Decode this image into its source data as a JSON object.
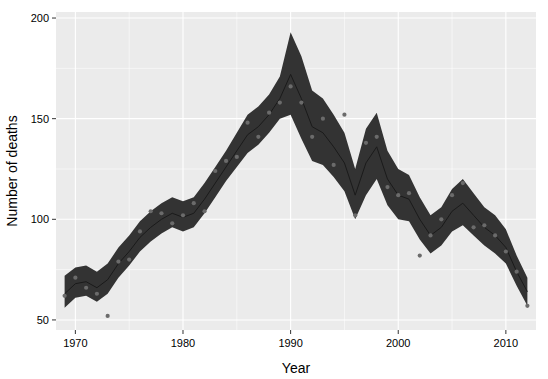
{
  "chart_data": {
    "type": "line",
    "title": "",
    "subtitle": "",
    "xlabel": "Year",
    "ylabel": "Number of deaths",
    "xlim": [
      1968.2,
      1912.0
    ],
    "x_range": [
      1968.2,
      2012.8
    ],
    "ylim": [
      45,
      203
    ],
    "y_ticks": [
      50,
      100,
      150,
      200
    ],
    "y_tick_labels": [
      "50",
      "100",
      "150",
      "200"
    ],
    "x_ticks": [
      1970,
      1980,
      1990,
      2000,
      2010
    ],
    "x_tick_labels": [
      "1970",
      "1980",
      "1990",
      "2000",
      "2010"
    ],
    "x_minor_ticks": [
      1975,
      1985,
      1995,
      2005
    ],
    "y_minor_ticks": [
      75,
      125,
      175
    ],
    "grid": true,
    "legend": "none",
    "panel_background": "#ebebeb",
    "grid_color": "#ffffff",
    "ribbon_color": "#333333",
    "line_color": "#1a1a1a",
    "point_color": "#6b6b6b",
    "series": [
      {
        "name": "Fitted number of deaths",
        "x": [
          1969,
          1970,
          1971,
          1972,
          1973,
          1974,
          1975,
          1976,
          1977,
          1978,
          1979,
          1980,
          1981,
          1982,
          1983,
          1984,
          1985,
          1986,
          1987,
          1988,
          1989,
          1990,
          1991,
          1992,
          1993,
          1994,
          1995,
          1996,
          1997,
          1998,
          1999,
          2000,
          2001,
          2002,
          2003,
          2004,
          2005,
          2006,
          2007,
          2008,
          2009,
          2010,
          2011,
          2012
        ],
        "fit": [
          63,
          68,
          69,
          66,
          70,
          78,
          84,
          91,
          96,
          100,
          103,
          101,
          103,
          110,
          118,
          126,
          134,
          142,
          146,
          152,
          160,
          172,
          160,
          146,
          143,
          136,
          128,
          112,
          128,
          136,
          120,
          112,
          110,
          100,
          92,
          96,
          104,
          108,
          102,
          96,
          92,
          86,
          74,
          64
        ],
        "lower": [
          56,
          61,
          62,
          59,
          63,
          71,
          77,
          84,
          89,
          93,
          96,
          94,
          96,
          103,
          111,
          119,
          126,
          133,
          137,
          143,
          150,
          152,
          140,
          129,
          127,
          121,
          114,
          100,
          112,
          120,
          107,
          100,
          99,
          90,
          83,
          87,
          94,
          97,
          92,
          87,
          83,
          78,
          67,
          57
        ],
        "upper": [
          72,
          76,
          77,
          74,
          78,
          86,
          92,
          99,
          104,
          108,
          111,
          109,
          111,
          118,
          126,
          134,
          143,
          152,
          156,
          162,
          171,
          193,
          181,
          164,
          160,
          152,
          143,
          125,
          145,
          153,
          134,
          125,
          122,
          111,
          102,
          106,
          115,
          120,
          113,
          106,
          102,
          95,
          82,
          71
        ]
      }
    ],
    "observed_points": {
      "name": "Observed deaths",
      "x": [
        1969,
        1970,
        1971,
        1972,
        1973,
        1974,
        1975,
        1976,
        1977,
        1978,
        1979,
        1980,
        1981,
        1982,
        1983,
        1984,
        1985,
        1986,
        1987,
        1988,
        1989,
        1990,
        1991,
        1992,
        1993,
        1994,
        1995,
        1996,
        1997,
        1998,
        1999,
        2000,
        2001,
        2002,
        2003,
        2004,
        2005,
        2006,
        2007,
        2008,
        2009,
        2010,
        2011,
        2012
      ],
      "y": [
        62,
        71,
        66,
        63,
        52,
        79,
        80,
        94,
        104,
        103,
        98,
        102,
        108,
        104,
        124,
        129,
        131,
        148,
        141,
        153,
        158,
        166,
        158,
        141,
        150,
        127,
        152,
        102,
        138,
        141,
        116,
        112,
        113,
        82,
        92,
        100,
        112,
        118,
        96,
        97,
        92,
        84,
        74,
        57
      ]
    }
  }
}
